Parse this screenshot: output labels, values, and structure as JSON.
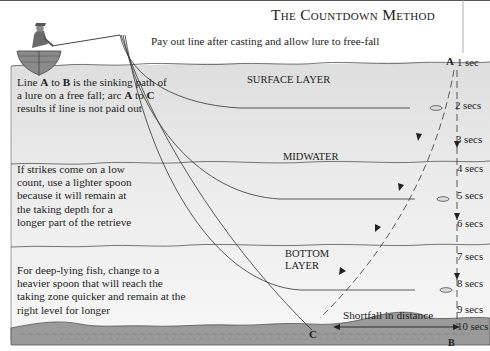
{
  "title": "The Countdown Method",
  "subtitle": "Pay out line after casting and allow lure to free-fall",
  "notes": {
    "surface": {
      "pre1": "Line ",
      "a1": "A",
      "mid1": " to ",
      "b1": "B",
      "post1": " is the sinking path of a lure on a free fall; arc ",
      "a2": "A",
      "mid2": " to ",
      "c1": "C",
      "post2": " results if line is not paid out"
    },
    "midwater": "If strikes come on a low count, use a lighter spoon because it will remain at the taking depth for a longer part of the retrieve",
    "bottom": "For deep-lying fish, change to a heavier spoon that will reach the taking zone quicker and remain at the right level for longer"
  },
  "layers": {
    "surface": "SURFACE LAYER",
    "midwater": "MIDWATER",
    "bottom_line1": "BOTTOM",
    "bottom_line2": "LAYER"
  },
  "points": {
    "a": "A",
    "b": "B",
    "c": "C"
  },
  "shortfall_label": "Shortfall in distance",
  "countdown": [
    {
      "label": "1 sec"
    },
    {
      "label": "2 secs"
    },
    {
      "label": "3 secs"
    },
    {
      "label": "4 secs"
    },
    {
      "label": "5 secs"
    },
    {
      "label": "6 secs"
    },
    {
      "label": "7 secs"
    },
    {
      "label": "8 secs"
    },
    {
      "label": "9 secs"
    },
    {
      "label": "10 secs"
    }
  ],
  "colors": {
    "water_surface": "#e4e4e4",
    "water_mid": "#efefef",
    "bed": "#8c8c8c",
    "line": "#333333"
  }
}
